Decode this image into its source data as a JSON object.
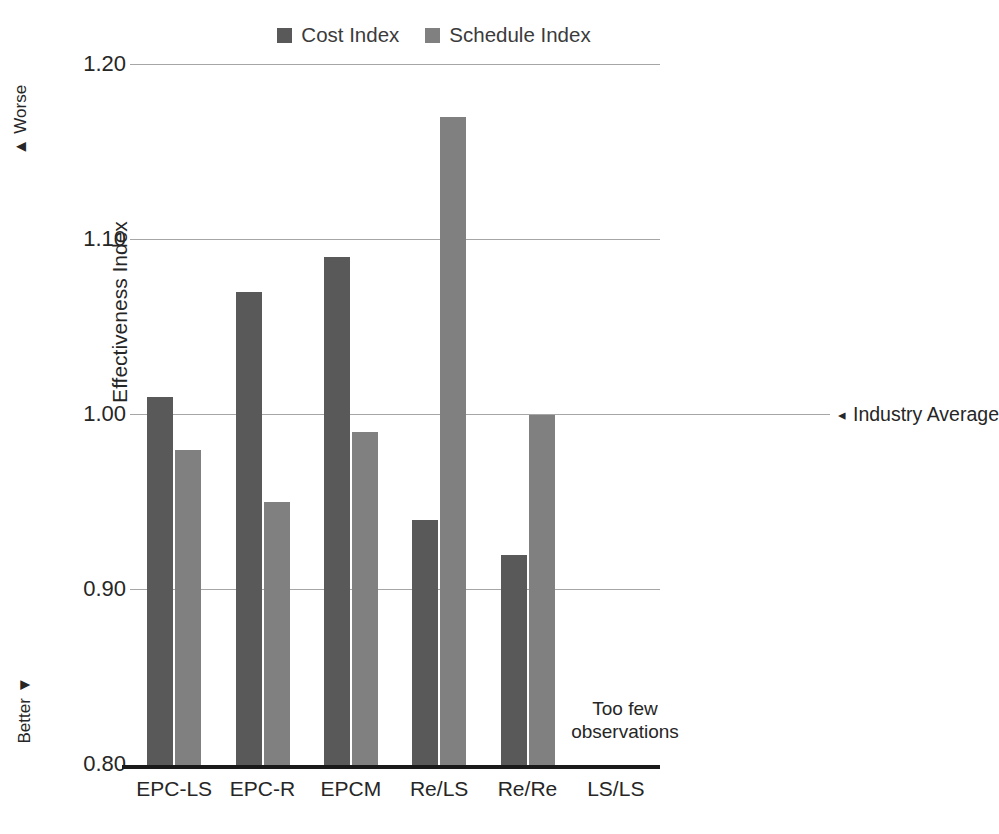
{
  "chart_data": {
    "type": "bar",
    "title": "",
    "xlabel": "",
    "ylabel": "Effectiveness Index",
    "ylim": [
      0.8,
      1.2
    ],
    "yticks": [
      "1.20",
      "1.10",
      "1.00",
      "0.90",
      "0.80"
    ],
    "ytick_values": [
      1.2,
      1.1,
      1.0,
      0.9,
      0.8
    ],
    "grid": true,
    "legend_position": "top-center",
    "categories": [
      "EPC-LS",
      "EPC-R",
      "EPCM",
      "Re/LS",
      "Re/Re",
      "LS/LS"
    ],
    "series": [
      {
        "name": "Cost Index",
        "color": "#595959",
        "values": [
          1.01,
          1.07,
          1.09,
          0.94,
          0.92,
          null
        ]
      },
      {
        "name": "Schedule Index",
        "color": "#808080",
        "values": [
          0.98,
          0.95,
          0.99,
          1.17,
          1.0,
          null
        ]
      }
    ],
    "annotations": [
      {
        "name": "industry-average",
        "text": "Industry Average",
        "arrow": "◂",
        "y_value": 1.0
      },
      {
        "name": "too-few-observations",
        "text": "Too few\nobservations",
        "category": "LS/LS"
      }
    ],
    "direction_markers": [
      {
        "name": "worse",
        "label": "Worse",
        "arrow": "▲"
      },
      {
        "name": "better",
        "label": "Better",
        "arrow": "▼"
      }
    ]
  },
  "legend": {
    "items": [
      {
        "label": "Cost Index",
        "color": "#595959"
      },
      {
        "label": "Schedule Index",
        "color": "#808080"
      }
    ]
  },
  "axis": {
    "y_title": "Effectiveness Index",
    "worse_label": "Worse",
    "worse_arrow": "▲",
    "better_label": "Better",
    "better_arrow": "▼"
  },
  "annotations": {
    "industry_average_arrow": "◂",
    "industry_average_label": "Industry Average",
    "too_few_line1": "Too few",
    "too_few_line2": "observations"
  }
}
